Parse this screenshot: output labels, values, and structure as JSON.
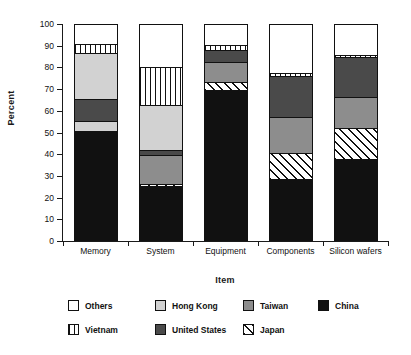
{
  "chart_data": {
    "type": "bar",
    "stacked": true,
    "title": "",
    "xlabel": "Item",
    "ylabel": "Percent",
    "ylim": [
      0,
      100
    ],
    "yticks": [
      0,
      10,
      20,
      30,
      40,
      50,
      60,
      70,
      80,
      90,
      100
    ],
    "ytick_labels": [
      "0",
      "10",
      "20",
      "30",
      "40",
      "50",
      "60",
      "70",
      "80",
      "90",
      "100"
    ],
    "grid": false,
    "legend_position": "bottom",
    "categories": [
      "Memory",
      "System",
      "Equipment",
      "Components",
      "Silicon wafers"
    ],
    "stack_order_bottom_to_top": [
      "China",
      "Japan",
      "Hong Kong",
      "Taiwan",
      "United States",
      "Vietnam",
      "Others"
    ],
    "series": [
      {
        "name": "China",
        "fill": "solid-black",
        "color": "#111111",
        "values": [
          50.5,
          25.5,
          69.5,
          28.5,
          38.0
        ]
      },
      {
        "name": "Japan",
        "fill": "diagonal-hatch",
        "color": "#ffffff",
        "values": [
          0.5,
          1.0,
          4.0,
          12.0,
          14.0
        ]
      },
      {
        "name": "Hong Kong",
        "fill": "light-gray",
        "color": "#d2d2d2",
        "values": [
          4.5,
          13.0,
          9.0,
          16.5,
          14.5
        ]
      },
      {
        "name": "Taiwan",
        "fill": "medium-gray",
        "color": "#8d8d8d",
        "values": [
          0.0,
          0.0,
          0.0,
          0.0,
          0.0
        ]
      },
      {
        "name": "United States",
        "fill": "dark-gray",
        "color": "#4a4a4a",
        "values": [
          10.0,
          2.5,
          5.5,
          19.0,
          18.5
        ]
      },
      {
        "name": "Vietnam",
        "fill": "vertical-lines",
        "color": "#ffffff",
        "values": [
          4.5,
          17.5,
          2.5,
          1.5,
          0.5
        ]
      },
      {
        "name": "Others",
        "fill": "white",
        "color": "#ffffff",
        "values": [
          9.0,
          20.0,
          9.5,
          22.5,
          14.5
        ]
      }
    ],
    "bars": [
      {
        "category": "Memory",
        "segments": [
          {
            "name": "China",
            "from": 0.0,
            "to": 50.5
          },
          {
            "name": "Hong Kong",
            "from": 50.5,
            "to": 55.5
          },
          {
            "name": "Taiwan",
            "from": 55.5,
            "to": 55.5
          },
          {
            "name": "United States",
            "from": 55.5,
            "to": 65.5
          },
          {
            "name": "Hong Kong",
            "from": 65.5,
            "to": 86.5
          },
          {
            "name": "Vietnam",
            "from": 86.5,
            "to": 91.0
          },
          {
            "name": "Others",
            "from": 91.0,
            "to": 100.0
          }
        ]
      },
      {
        "category": "System",
        "segments": [
          {
            "name": "China",
            "from": 0.0,
            "to": 25.5
          },
          {
            "name": "Japan",
            "from": 25.5,
            "to": 26.5
          },
          {
            "name": "Taiwan",
            "from": 26.5,
            "to": 39.5
          },
          {
            "name": "United States",
            "from": 39.5,
            "to": 42.0
          },
          {
            "name": "Hong Kong",
            "from": 42.0,
            "to": 62.5
          },
          {
            "name": "Vietnam",
            "from": 62.5,
            "to": 80.0
          },
          {
            "name": "Others",
            "from": 80.0,
            "to": 100.0
          }
        ]
      },
      {
        "category": "Equipment",
        "segments": [
          {
            "name": "China",
            "from": 0.0,
            "to": 69.5
          },
          {
            "name": "Japan",
            "from": 69.5,
            "to": 73.5
          },
          {
            "name": "Taiwan",
            "from": 73.5,
            "to": 82.5
          },
          {
            "name": "United States",
            "from": 82.5,
            "to": 88.0
          },
          {
            "name": "Vietnam",
            "from": 88.0,
            "to": 90.5
          },
          {
            "name": "Others",
            "from": 90.5,
            "to": 100.0
          }
        ]
      },
      {
        "category": "Components",
        "segments": [
          {
            "name": "China",
            "from": 0.0,
            "to": 28.5
          },
          {
            "name": "Japan",
            "from": 28.5,
            "to": 40.5
          },
          {
            "name": "Taiwan",
            "from": 40.5,
            "to": 57.0
          },
          {
            "name": "United States",
            "from": 57.0,
            "to": 76.0
          },
          {
            "name": "Vietnam",
            "from": 76.0,
            "to": 77.5
          },
          {
            "name": "Others",
            "from": 77.5,
            "to": 100.0
          }
        ]
      },
      {
        "category": "Silicon wafers",
        "segments": [
          {
            "name": "China",
            "from": 0.0,
            "to": 38.0
          },
          {
            "name": "Japan",
            "from": 38.0,
            "to": 52.0
          },
          {
            "name": "Taiwan",
            "from": 52.0,
            "to": 66.5
          },
          {
            "name": "United States",
            "from": 66.5,
            "to": 85.0
          },
          {
            "name": "Vietnam",
            "from": 85.0,
            "to": 85.5
          },
          {
            "name": "Others",
            "from": 85.5,
            "to": 100.0
          }
        ]
      }
    ],
    "legend": [
      {
        "label": "Others",
        "swatch": "white",
        "row": 0,
        "col": 0
      },
      {
        "label": "Hong Kong",
        "swatch": "light-gray",
        "row": 0,
        "col": 1
      },
      {
        "label": "Taiwan",
        "swatch": "medium-gray",
        "row": 0,
        "col": 2
      },
      {
        "label": "China",
        "swatch": "solid-black",
        "row": 0,
        "col": 3
      },
      {
        "label": "Vietnam",
        "swatch": "vertical-lines",
        "row": 1,
        "col": 0
      },
      {
        "label": "United States",
        "swatch": "dark-gray",
        "row": 1,
        "col": 1
      },
      {
        "label": "Japan",
        "swatch": "diagonal-hatch",
        "row": 1,
        "col": 2
      }
    ]
  }
}
